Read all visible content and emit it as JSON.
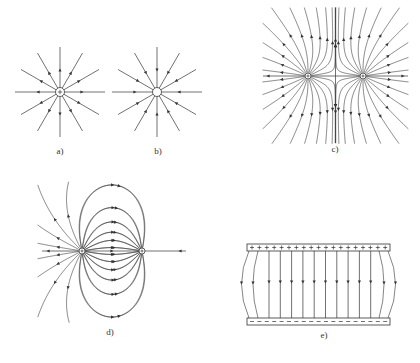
{
  "figure": {
    "panels": [
      {
        "id": "a",
        "label": "a)",
        "description": "Field lines of isolated positive point charge (arrows pointing outward)",
        "charge": "+",
        "center": [
          60,
          92
        ],
        "label_pos": [
          60,
          152
        ]
      },
      {
        "id": "b",
        "label": "b)",
        "description": "Field lines of isolated negative point charge (arrows pointing inward)",
        "charge": "-",
        "center": [
          157,
          92
        ],
        "label_pos": [
          158,
          152
        ]
      },
      {
        "id": "c",
        "label": "c)",
        "description": "Field lines of two like (positive) charges repelling",
        "charges": [
          "+",
          "+"
        ],
        "centers": [
          [
            308,
            76
          ],
          [
            363,
            76
          ]
        ],
        "label_pos": [
          335,
          150
        ]
      },
      {
        "id": "d",
        "label": "d)",
        "description": "Field lines of electric dipole (positive and negative charges)",
        "charges": [
          "+",
          "-"
        ],
        "centers": [
          [
            82,
            251
          ],
          [
            142,
            251
          ]
        ],
        "label_pos": [
          110,
          333
        ]
      },
      {
        "id": "e",
        "label": "e)",
        "description": "Uniform field between parallel charged plates, fringing at edges",
        "top_plate": "+",
        "bottom_plate": "-",
        "label_pos": [
          324,
          336
        ]
      }
    ],
    "colors": {
      "line": "#333333",
      "background": "#ffffff"
    }
  }
}
